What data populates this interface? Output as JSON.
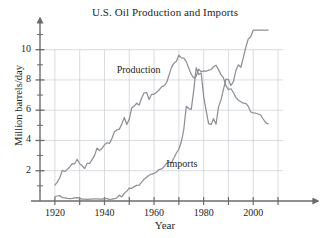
{
  "chart_data": {
    "type": "line",
    "title": "U.S. Oil Production and Imports",
    "xlabel": "Year",
    "ylabel": "Million barrels/day",
    "xlim": [
      1914,
      2012
    ],
    "ylim": [
      0,
      11.3
    ],
    "grid": true,
    "grid_color": "#c9cdd3",
    "legend_position": "inline-annotation",
    "x_major_ticks": [
      1920,
      1940,
      1960,
      1980,
      2000
    ],
    "x_minor_ticks": [
      1930,
      1950,
      1970,
      1990,
      2010
    ],
    "x_tick_labels": [
      "1920",
      "1940",
      "1960",
      "1980",
      "2000"
    ],
    "y_major_ticks": [
      2,
      4,
      6,
      8,
      10
    ],
    "y_minor_ticks": [
      1,
      3,
      5,
      7,
      9,
      11
    ],
    "y_tick_labels": [
      "2",
      "4",
      "6",
      "8",
      "10"
    ],
    "axis_color": "#6b6b6b",
    "series": [
      {
        "name": "Production",
        "color": "#8e9095",
        "annotation": "Production",
        "annotation_year": 1955,
        "annotation_value": 8.6,
        "x": [
          1920,
          1921,
          1922,
          1923,
          1924,
          1925,
          1926,
          1927,
          1928,
          1929,
          1930,
          1931,
          1932,
          1933,
          1934,
          1935,
          1936,
          1937,
          1938,
          1939,
          1940,
          1941,
          1942,
          1943,
          1944,
          1945,
          1946,
          1947,
          1948,
          1949,
          1950,
          1951,
          1952,
          1953,
          1954,
          1955,
          1956,
          1957,
          1958,
          1959,
          1960,
          1961,
          1962,
          1963,
          1964,
          1965,
          1966,
          1967,
          1968,
          1969,
          1970,
          1971,
          1972,
          1973,
          1974,
          1975,
          1976,
          1977,
          1978,
          1979,
          1980,
          1981,
          1982,
          1983,
          1984,
          1985,
          1986,
          1987,
          1988,
          1989,
          1990,
          1991,
          1992,
          1993,
          1994,
          1995,
          1996,
          1997,
          1998,
          1999,
          2000,
          2001,
          2002,
          2003,
          2004,
          2005,
          2006
        ],
        "y": [
          1.05,
          1.25,
          1.55,
          2.02,
          1.95,
          2.09,
          2.25,
          2.47,
          2.46,
          2.76,
          2.46,
          2.33,
          2.15,
          2.48,
          2.49,
          2.73,
          3.0,
          3.5,
          3.33,
          3.47,
          3.71,
          3.85,
          3.8,
          4.12,
          4.58,
          4.7,
          4.75,
          5.09,
          5.52,
          5.05,
          5.41,
          6.16,
          6.27,
          6.46,
          6.34,
          6.81,
          7.15,
          7.17,
          6.71,
          7.05,
          7.05,
          7.18,
          7.33,
          7.54,
          7.61,
          7.8,
          8.3,
          8.81,
          9.1,
          9.24,
          9.64,
          9.46,
          9.44,
          9.21,
          8.77,
          8.37,
          8.13,
          8.25,
          8.71,
          8.55,
          8.6,
          8.57,
          8.65,
          8.69,
          8.88,
          8.97,
          8.68,
          8.35,
          8.14,
          7.61,
          7.36,
          7.42,
          7.17,
          6.85,
          6.66,
          6.56,
          6.47,
          6.45,
          6.25,
          5.88,
          5.82,
          5.8,
          5.75,
          5.68,
          5.42,
          5.18,
          5.1
        ]
      },
      {
        "name": "Imports",
        "color": "#8e9095",
        "annotation": "Imports",
        "annotation_year": 1975,
        "annotation_value": 2.35,
        "x": [
          1920,
          1921,
          1922,
          1923,
          1924,
          1925,
          1926,
          1927,
          1928,
          1929,
          1930,
          1931,
          1932,
          1933,
          1934,
          1935,
          1936,
          1937,
          1938,
          1939,
          1940,
          1941,
          1942,
          1943,
          1944,
          1945,
          1946,
          1947,
          1948,
          1949,
          1950,
          1951,
          1952,
          1953,
          1954,
          1955,
          1956,
          1957,
          1958,
          1959,
          1960,
          1961,
          1962,
          1963,
          1964,
          1965,
          1966,
          1967,
          1968,
          1969,
          1970,
          1971,
          1972,
          1973,
          1974,
          1975,
          1976,
          1977,
          1978,
          1979,
          1980,
          1981,
          1982,
          1983,
          1984,
          1985,
          1986,
          1987,
          1988,
          1989,
          1990,
          1991,
          1992,
          1993,
          1994,
          1995,
          1996,
          1997,
          1998,
          1999,
          2000,
          2001,
          2002,
          2003,
          2004,
          2005,
          2006
        ],
        "y": [
          0.28,
          0.33,
          0.36,
          0.22,
          0.21,
          0.17,
          0.15,
          0.17,
          0.21,
          0.22,
          0.17,
          0.13,
          0.12,
          0.1,
          0.12,
          0.13,
          0.14,
          0.14,
          0.13,
          0.13,
          0.16,
          0.16,
          0.11,
          0.12,
          0.15,
          0.21,
          0.38,
          0.27,
          0.52,
          0.65,
          0.85,
          0.84,
          0.95,
          1.03,
          1.05,
          1.25,
          1.44,
          1.57,
          1.7,
          1.78,
          1.82,
          1.92,
          2.08,
          2.12,
          2.26,
          2.47,
          2.57,
          2.54,
          2.84,
          3.17,
          3.42,
          3.93,
          4.74,
          6.26,
          6.11,
          6.06,
          7.31,
          8.81,
          8.36,
          8.46,
          6.91,
          5.99,
          5.11,
          5.05,
          5.44,
          5.07,
          6.22,
          6.68,
          7.4,
          8.06,
          8.02,
          7.63,
          7.89,
          8.62,
          9.0,
          8.84,
          9.48,
          10.16,
          10.71,
          10.85,
          11.46,
          11.87,
          11.53,
          12.26,
          13.15,
          13.71,
          13.71
        ]
      }
    ]
  },
  "figure": {
    "footer_text": ""
  }
}
